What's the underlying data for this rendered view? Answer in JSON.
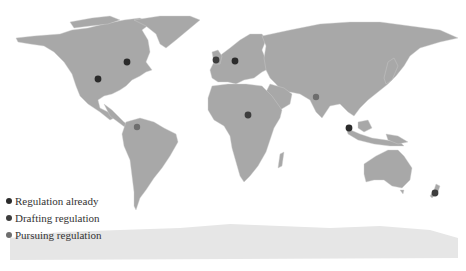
{
  "map": {
    "land_color": "#a8a8a8",
    "antarctica_color": "#e6e6e6",
    "border_color": "#cfcfcf",
    "markers": [
      {
        "region": "Canada",
        "category": "already",
        "x": 127,
        "y": 62
      },
      {
        "region": "United States",
        "category": "already",
        "x": 98,
        "y": 79
      },
      {
        "region": "United Kingdom",
        "category": "drafting",
        "x": 216,
        "y": 60
      },
      {
        "region": "Germany",
        "category": "already",
        "x": 235,
        "y": 61
      },
      {
        "region": "Central Africa",
        "category": "drafting",
        "x": 248,
        "y": 115
      },
      {
        "region": "India",
        "category": "pursuing",
        "x": 316,
        "y": 97
      },
      {
        "region": "Malaysia",
        "category": "already",
        "x": 349,
        "y": 128
      },
      {
        "region": "Venezuela",
        "category": "pursuing",
        "x": 137,
        "y": 127
      },
      {
        "region": "New Zealand",
        "category": "drafting",
        "x": 435,
        "y": 193
      }
    ]
  },
  "legend": {
    "items": [
      {
        "key": "already",
        "label": "Regulation already",
        "color": "#2b2b2b"
      },
      {
        "key": "drafting",
        "label": "Drafting regulation",
        "color": "#3d3d3d"
      },
      {
        "key": "pursuing",
        "label": "Pursuing regulation",
        "color": "#6e6e6e"
      }
    ]
  }
}
